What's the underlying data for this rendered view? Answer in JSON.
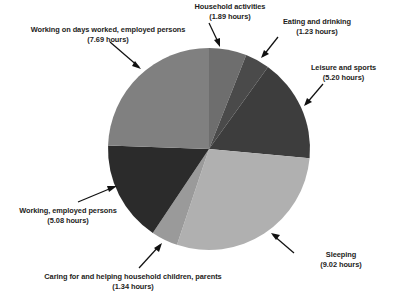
{
  "chart_data": {
    "type": "pie",
    "title": "",
    "subtitle": "",
    "xlabel": "",
    "ylabel": "",
    "units": "hours",
    "total": 31.45,
    "legend_position": "none",
    "grid": false,
    "start_angle_deg": 0,
    "direction": "clockwise",
    "categories": [
      "Household activities",
      "Eating and drinking",
      "Leisure and sports",
      "Sleeping",
      "Caring for and helping household children, parents",
      "Working, employed persons",
      "Working on days worked, employed persons"
    ],
    "values": [
      1.89,
      1.23,
      5.2,
      9.02,
      1.34,
      5.08,
      7.69
    ],
    "colors": [
      "#6e6e6e",
      "#4a4a4a",
      "#3d3d3d",
      "#b0b0b0",
      "#9a9a9a",
      "#2b2b2b",
      "#808080"
    ],
    "slices": [
      {
        "label": "Household activities",
        "value": 1.89,
        "value_text": "(1.89 hours)",
        "color": "#6e6e6e"
      },
      {
        "label": "Eating and drinking",
        "value": 1.23,
        "value_text": "(1.23 hours)",
        "color": "#4a4a4a"
      },
      {
        "label": "Leisure and sports",
        "value": 5.2,
        "value_text": "(5.20 hours)",
        "color": "#3d3d3d"
      },
      {
        "label": "Sleeping",
        "value": 9.02,
        "value_text": "(9.02 hours)",
        "color": "#b0b0b0"
      },
      {
        "label": "Caring for and helping household children, parents",
        "value": 1.34,
        "value_text": "(1.34 hours)",
        "color": "#9a9a9a"
      },
      {
        "label": "Working, employed persons",
        "value": 5.08,
        "value_text": "(5.08 hours)",
        "color": "#2b2b2b"
      },
      {
        "label": "Working on days worked, employed persons",
        "value": 7.69,
        "value_text": "(7.69 hours)",
        "color": "#808080"
      }
    ]
  },
  "labels": {
    "working_days": {
      "name": "Working on days worked, employed persons",
      "value": "(7.69 hours)"
    },
    "household": {
      "name": "Household activities",
      "value": "(1.89 hours)"
    },
    "eating": {
      "name": "Eating and drinking",
      "value": "(1.23 hours)"
    },
    "leisure": {
      "name": "Leisure and sports",
      "value": "(5.20 hours)"
    },
    "sleeping": {
      "name": "Sleeping",
      "value": "(9.02 hours)"
    },
    "caring": {
      "name": "Caring for and helping household children, parents",
      "value": "(1.34 hours)"
    },
    "working_emp": {
      "name": "Working, employed persons",
      "value": "(5.08 hours)"
    }
  },
  "geometry": {
    "cx": 209,
    "cy": 149,
    "r": 101
  }
}
